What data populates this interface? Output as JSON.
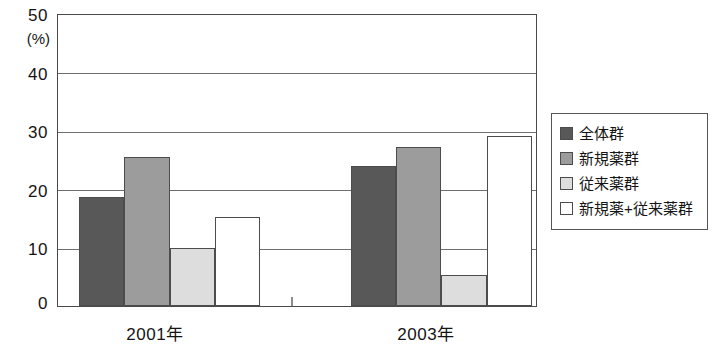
{
  "chart_data": {
    "type": "bar",
    "title": "",
    "subtitle": "",
    "xlabel": "",
    "ylabel": "(%)",
    "ylim": [
      0,
      50
    ],
    "yticks": [
      0,
      10,
      20,
      30,
      40,
      50
    ],
    "ytick_labels": [
      "0",
      "10",
      "20",
      "30",
      "40",
      "50"
    ],
    "grid": true,
    "grid_axis": "y",
    "legend_position": "right",
    "categories": [
      "2001年",
      "2003年"
    ],
    "series": [
      {
        "name": "全体群",
        "color": "#585858",
        "values": [
          18.8,
          24.0
        ]
      },
      {
        "name": "新規薬群",
        "color": "#9c9c9c",
        "values": [
          25.6,
          27.4
        ]
      },
      {
        "name": "従来薬群",
        "color": "#dddddd",
        "values": [
          10.0,
          5.4
        ]
      },
      {
        "name": "新規薬+従来薬群",
        "color": "#ffffff",
        "values": [
          15.3,
          29.2
        ]
      }
    ]
  },
  "axes": {
    "y_unit": "(%)",
    "y_tick_0": "0",
    "y_tick_10": "10",
    "y_tick_20": "20",
    "y_tick_30": "30",
    "y_tick_40": "40",
    "y_tick_50": "50",
    "x_label_group_1": "2001年",
    "x_label_group_2": "2003年"
  },
  "legend": {
    "entries": [
      {
        "label": "全体群",
        "color": "#585858"
      },
      {
        "label": "新規薬群",
        "color": "#9c9c9c"
      },
      {
        "label": "従来薬群",
        "color": "#dddddd"
      },
      {
        "label": "新規薬+従来薬群",
        "color": "#ffffff"
      }
    ]
  }
}
